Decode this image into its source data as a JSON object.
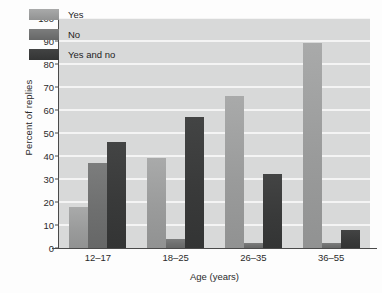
{
  "chart_data": {
    "type": "bar",
    "title": "",
    "subtitle": "",
    "xlabel": "Age (years)",
    "ylabel": "Percent of replies",
    "categories": [
      "12–17",
      "18–25",
      "26–35",
      "36–55"
    ],
    "series": [
      {
        "name": "Yes",
        "color": "#9a9b9b",
        "values": [
          18,
          39,
          66,
          89
        ]
      },
      {
        "name": "No",
        "color": "#6e6f6f",
        "values": [
          37,
          4,
          2,
          2
        ]
      },
      {
        "name": "Yes and no",
        "color": "#393a3a",
        "values": [
          46,
          57,
          32,
          8
        ]
      }
    ],
    "ylim": [
      0,
      100
    ],
    "yticks": [
      0,
      10,
      20,
      30,
      40,
      50,
      60,
      70,
      80,
      90,
      100
    ],
    "ytick_labels": [
      "0",
      "10",
      "20",
      "30",
      "40",
      "50",
      "60",
      "70",
      "80",
      "90",
      "100"
    ],
    "grid": true,
    "grid_axis": "y",
    "grid_color": "#f4f4f4",
    "plot_background": "#d8d9d9",
    "legend_position": "upper-left-inside",
    "legend_entries": [
      "Yes",
      "No",
      "Yes and no"
    ]
  }
}
